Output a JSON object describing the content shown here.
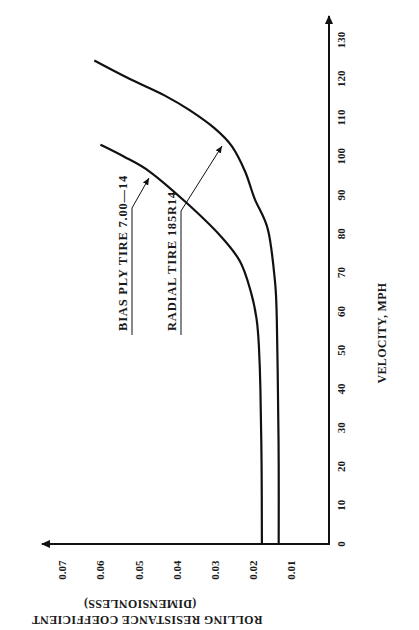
{
  "chart_data": {
    "type": "line",
    "orientation_note": "figure printed rotated 90 degrees counter-clockwise",
    "title": "",
    "xlabel": "VELOCITY, MPH",
    "ylabel": "ROLLING RESISTANCE COEFFICIENT",
    "ylabel_sub": "(DIMENSIONLESS)",
    "xlim": [
      0,
      130
    ],
    "ylim": [
      0,
      0.07
    ],
    "x_ticks": [
      0,
      10,
      20,
      30,
      40,
      50,
      60,
      70,
      80,
      90,
      100,
      110,
      120,
      130
    ],
    "y_ticks": [
      0.01,
      0.02,
      0.03,
      0.04,
      0.05,
      0.06,
      0.07
    ],
    "grid": false,
    "legend": "inline labels with leader arrows",
    "series": [
      {
        "name": "BIAS PLY TIRE 7.00—14",
        "x": [
          0,
          20,
          40,
          51,
          58,
          65,
          73,
          80,
          88,
          96,
          100,
          103
        ],
        "values": [
          0.0176,
          0.0177,
          0.018,
          0.0184,
          0.019,
          0.0205,
          0.0234,
          0.029,
          0.0374,
          0.047,
          0.054,
          0.06
        ]
      },
      {
        "name": "RADIAL TIRE 185R14",
        "x": [
          0,
          20,
          40,
          58,
          68,
          81,
          89,
          96,
          102.6,
          107.2,
          111.9,
          115.7,
          120,
          124.7
        ],
        "values": [
          0.0132,
          0.0132,
          0.0134,
          0.0137,
          0.0142,
          0.016,
          0.0195,
          0.022,
          0.0255,
          0.03,
          0.0366,
          0.0432,
          0.0524,
          0.0616
        ]
      }
    ]
  },
  "labels": {
    "xlabel": "VELOCITY, MPH",
    "ylabel": "ROLLING RESISTANCE COEFFICIENT",
    "ylabel_sub": "(DIMENSIONLESS)",
    "bias": "BIAS PLY TIRE 7.00—14",
    "radial": "RADIAL TIRE 185R14"
  }
}
